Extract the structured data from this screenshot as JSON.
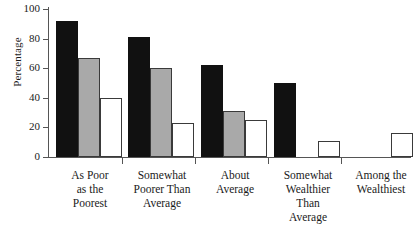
{
  "chart_data": {
    "type": "bar",
    "title": "",
    "xlabel": "",
    "ylabel": "Percentage",
    "ylim": [
      0,
      100
    ],
    "yticks": [
      0,
      20,
      40,
      60,
      80,
      100
    ],
    "ytick_labels": [
      "0",
      "20",
      "40",
      "60",
      "80",
      "100"
    ],
    "grid": false,
    "legend": "none",
    "categories": [
      "As Poor\nas the\nPoorest",
      "Somewhat\nPoorer Than\nAverage",
      "About\nAverage",
      "Somewhat\nWealthier\nThan\nAverage",
      "Among the\nWealthiest"
    ],
    "series": [
      {
        "name": "series-1",
        "style": "black",
        "color": "#111111",
        "values": [
          92,
          81,
          62,
          50,
          0
        ]
      },
      {
        "name": "series-2",
        "style": "gray",
        "color": "#a9a9a9",
        "values": [
          67,
          60,
          31,
          0,
          0
        ]
      },
      {
        "name": "series-3",
        "style": "white",
        "color": "#ffffff",
        "values": [
          40,
          23,
          25,
          11,
          16
        ]
      }
    ]
  },
  "axis": {
    "y_title": "Percentage"
  }
}
